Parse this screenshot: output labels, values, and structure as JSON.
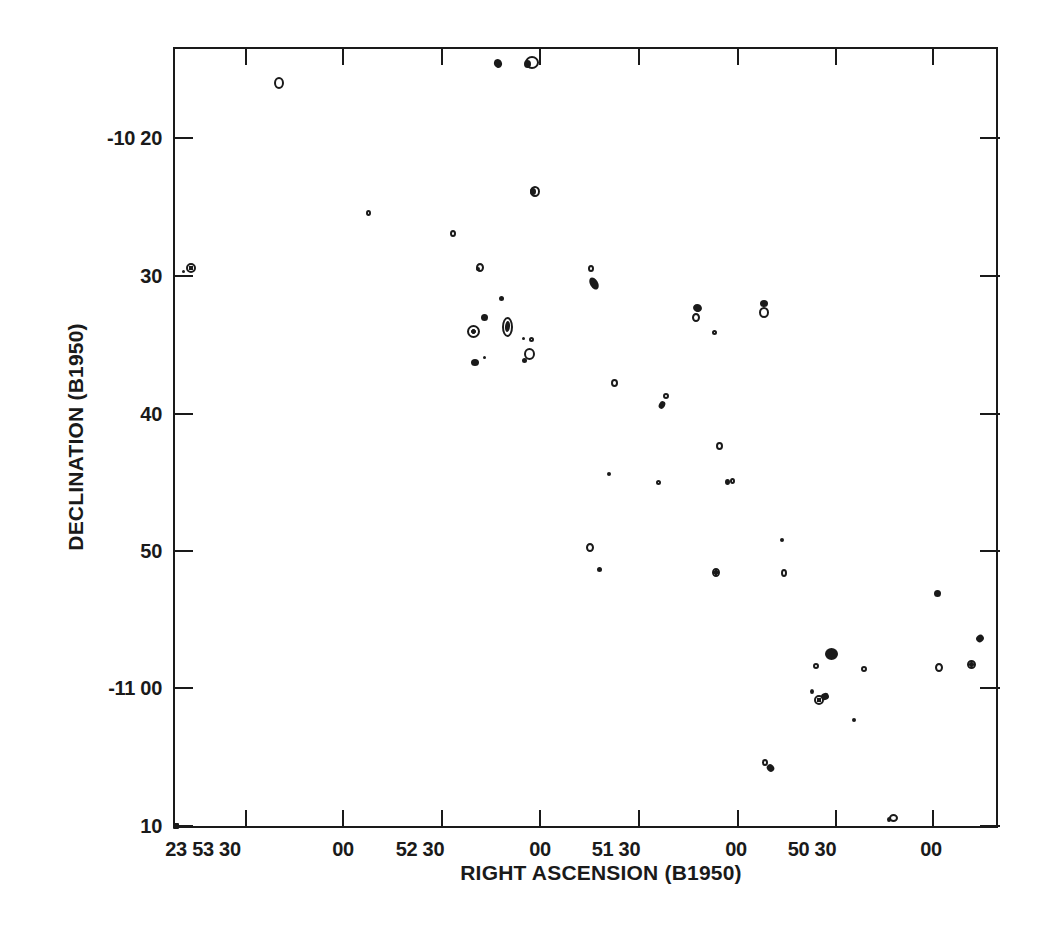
{
  "figure": {
    "ink_color": "#1a1a1a",
    "background_color": "#ffffff"
  },
  "chart_data": {
    "type": "scatter",
    "subtype": "radio-source-contour-sky-map",
    "title": "",
    "xlabel": "RIGHT ASCENSION (B1950)",
    "ylabel": "DECLINATION (B1950)",
    "grid": false,
    "legend": "none",
    "x_axis": {
      "unit": "hh mm ss (RA, increases to the left)",
      "tick_labels": [
        "23 53 30",
        "00",
        "52 30",
        "00",
        "51 30",
        "00",
        "50 30",
        "00"
      ],
      "range_left_to_right": [
        "23 53 52",
        "23 49 40"
      ]
    },
    "y_axis": {
      "unit": "dd mm (Declination)",
      "tick_labels": [
        "-10 20",
        "30",
        "40",
        "50",
        "-11 00",
        "10"
      ],
      "range_top_to_bottom": [
        "-10 13",
        "-11 10"
      ]
    },
    "sources": [
      {
        "ra": "23 53 20",
        "dec": "-10 16",
        "parts": [
          [
            279,
            83,
            10,
            12,
            "ring",
            0
          ]
        ]
      },
      {
        "ra": "23 52 13",
        "dec": "-10 15",
        "parts": [
          [
            498,
            63,
            8,
            9,
            "filled",
            -30
          ]
        ]
      },
      {
        "ra": "23 52 03",
        "dec": "-10 14",
        "parts": [
          [
            532,
            62,
            14,
            13,
            "ring",
            0
          ],
          [
            527,
            64,
            7,
            8,
            "filled",
            0
          ]
        ]
      },
      {
        "ra": "23 52 53",
        "dec": "-10 25",
        "parts": [
          [
            368,
            213,
            5,
            6,
            "ring",
            0
          ]
        ]
      },
      {
        "ra": "23 52 27",
        "dec": "-10 27",
        "parts": [
          [
            453,
            233,
            6,
            7,
            "ring",
            0
          ]
        ]
      },
      {
        "ra": "23 52 02",
        "dec": "-10 24",
        "parts": [
          [
            535,
            191,
            10,
            11,
            "ring",
            0
          ],
          [
            533,
            191,
            6,
            7,
            "filled",
            0
          ]
        ]
      },
      {
        "ra": "23 52 18",
        "dec": "-10 29",
        "parts": [
          [
            480,
            267,
            8,
            9,
            "ring",
            0
          ],
          [
            478,
            269,
            4,
            4,
            "filled",
            0
          ]
        ]
      },
      {
        "ra": "23 53 47",
        "dec": "-10 29",
        "parts": [
          [
            191,
            268,
            10,
            10,
            "bullseye",
            0
          ],
          [
            183,
            271,
            3,
            3,
            "filled",
            0
          ]
        ]
      },
      {
        "ra": "23 51 44",
        "dec": "-10 30",
        "parts": [
          [
            591,
            268,
            6,
            7,
            "ring",
            0
          ],
          [
            594,
            283,
            8,
            13,
            "filled",
            -30
          ]
        ]
      },
      {
        "ra": "23 52 12",
        "dec": "-10 32",
        "parts": [
          [
            501,
            298,
            5,
            5,
            "filled",
            0
          ]
        ]
      },
      {
        "ra": "23 52 17",
        "dec": "-10 33",
        "parts": [
          [
            484,
            317,
            7,
            7,
            "filled",
            0
          ]
        ]
      },
      {
        "ra": "23 52 21",
        "dec": "-10 34",
        "parts": [
          [
            473,
            331,
            13,
            13,
            "bullseye",
            0
          ]
        ]
      },
      {
        "ra": "23 52 10",
        "dec": "-10 34",
        "parts": [
          [
            507,
            327,
            11,
            20,
            "ring",
            0
          ],
          [
            507,
            326,
            5,
            11,
            "filled",
            5
          ]
        ]
      },
      {
        "ra": "23 52 04",
        "dec": "-10 35",
        "parts": [
          [
            523,
            338,
            3,
            3,
            "filled",
            0
          ],
          [
            531,
            339,
            5,
            5,
            "ring",
            0
          ]
        ]
      },
      {
        "ra": "23 52 04",
        "dec": "-10 36",
        "parts": [
          [
            529,
            354,
            11,
            12,
            "ring",
            0
          ],
          [
            524,
            360,
            5,
            5,
            "filled",
            0
          ]
        ]
      },
      {
        "ra": "23 52 21",
        "dec": "-10 36",
        "parts": [
          [
            475,
            362,
            8,
            7,
            "filled",
            0
          ],
          [
            484,
            357,
            3,
            3,
            "filled",
            0
          ]
        ]
      },
      {
        "ra": "23 51 12",
        "dec": "-10 33",
        "parts": [
          [
            697,
            308,
            9,
            8,
            "filled",
            20
          ],
          [
            696,
            317,
            8,
            9,
            "ring",
            0
          ]
        ]
      },
      {
        "ra": "23 51 07",
        "dec": "-10 34",
        "parts": [
          [
            714,
            332,
            5,
            5,
            "ring",
            0
          ]
        ]
      },
      {
        "ra": "23 50 52",
        "dec": "-10 32",
        "parts": [
          [
            764,
            303,
            8,
            7,
            "filled",
            0
          ],
          [
            764,
            312,
            10,
            11,
            "ring",
            0
          ]
        ]
      },
      {
        "ra": "23 51 38",
        "dec": "-10 38",
        "parts": [
          [
            614,
            383,
            7,
            8,
            "ring",
            0
          ]
        ]
      },
      {
        "ra": "23 51 22",
        "dec": "-10 39",
        "parts": [
          [
            666,
            396,
            6,
            6,
            "ring",
            0
          ],
          [
            662,
            405,
            6,
            8,
            "filled",
            30
          ]
        ]
      },
      {
        "ra": "23 51 05",
        "dec": "-10 42",
        "parts": [
          [
            719,
            446,
            7,
            8,
            "ring",
            0
          ]
        ]
      },
      {
        "ra": "23 51 39",
        "dec": "-10 44",
        "parts": [
          [
            609,
            474,
            4,
            4,
            "filled",
            0
          ]
        ]
      },
      {
        "ra": "23 51 24",
        "dec": "-10 45",
        "parts": [
          [
            658,
            482,
            5,
            5,
            "ring",
            0
          ]
        ]
      },
      {
        "ra": "23 51 02",
        "dec": "-10 45",
        "parts": [
          [
            727,
            482,
            5,
            6,
            "filled",
            0
          ],
          [
            732,
            481,
            5,
            6,
            "ring",
            0
          ]
        ]
      },
      {
        "ra": "23 51 45",
        "dec": "-10 50",
        "parts": [
          [
            590,
            547,
            8,
            9,
            "ring",
            0
          ]
        ]
      },
      {
        "ra": "23 51 42",
        "dec": "-10 51",
        "parts": [
          [
            599,
            569,
            5,
            5,
            "filled",
            0
          ]
        ]
      },
      {
        "ra": "23 51 06",
        "dec": "-10 52",
        "parts": [
          [
            716,
            572,
            8,
            9,
            "bullseye",
            0
          ]
        ]
      },
      {
        "ra": "23 50 46",
        "dec": "-10 52",
        "parts": [
          [
            784,
            573,
            6,
            8,
            "ring",
            0
          ]
        ]
      },
      {
        "ra": "23 50 46",
        "dec": "-10 49",
        "parts": [
          [
            782,
            540,
            4,
            4,
            "filled",
            0
          ]
        ]
      },
      {
        "ra": "23 49 59",
        "dec": "-10 53",
        "parts": [
          [
            937,
            593,
            7,
            7,
            "filled",
            0
          ]
        ]
      },
      {
        "ra": "23 49 46",
        "dec": "-10 56",
        "parts": [
          [
            980,
            638,
            8,
            7,
            "filled",
            -40
          ]
        ]
      },
      {
        "ra": "23 50 31",
        "dec": "-10 58",
        "parts": [
          [
            831,
            654,
            13,
            12,
            "filled",
            0
          ]
        ]
      },
      {
        "ra": "23 50 36",
        "dec": "-10 58",
        "parts": [
          [
            816,
            666,
            6,
            6,
            "ring",
            0
          ]
        ]
      },
      {
        "ra": "23 50 21",
        "dec": "-10 58",
        "parts": [
          [
            864,
            669,
            6,
            6,
            "ring",
            0
          ]
        ]
      },
      {
        "ra": "23 49 58",
        "dec": "-10 58",
        "parts": [
          [
            939,
            667,
            8,
            9,
            "ring",
            0
          ]
        ]
      },
      {
        "ra": "23 49 48",
        "dec": "-10 58",
        "parts": [
          [
            971,
            664,
            9,
            9,
            "bullseye",
            0
          ]
        ]
      },
      {
        "ra": "23 50 35",
        "dec": "-11 01",
        "parts": [
          [
            812,
            691,
            4,
            5,
            "filled",
            0
          ],
          [
            819,
            700,
            10,
            10,
            "bullseye",
            0
          ],
          [
            825,
            696,
            8,
            7,
            "filled",
            -20
          ]
        ]
      },
      {
        "ra": "23 50 24",
        "dec": "-11 02",
        "parts": [
          [
            854,
            720,
            4,
            4,
            "filled",
            0
          ]
        ]
      },
      {
        "ra": "23 50 51",
        "dec": "-11 06",
        "parts": [
          [
            765,
            762,
            6,
            7,
            "ring",
            0
          ],
          [
            770,
            768,
            7,
            8,
            "filled",
            -40
          ]
        ]
      },
      {
        "ra": "23 50 12",
        "dec": "-11 09",
        "parts": [
          [
            893,
            818,
            9,
            8,
            "ring",
            0
          ],
          [
            889,
            819,
            4,
            5,
            "filled",
            0
          ]
        ]
      },
      {
        "ra": "23 53 51",
        "dec": "-11 10",
        "parts": [
          [
            176,
            826,
            6,
            6,
            "square",
            0
          ]
        ]
      }
    ]
  },
  "plot": {
    "left": 173,
    "top": 47,
    "right": 998,
    "bottom": 828,
    "tick_len": 18,
    "x_label_top": 838,
    "x_ticks": [
      {
        "px": 246,
        "label": "23 53 30",
        "label_px": 203
      },
      {
        "px": 343,
        "label": "00",
        "label_px": 343
      },
      {
        "px": 442,
        "label": "52 30",
        "label_px": 420
      },
      {
        "px": 540,
        "label": "00",
        "label_px": 540
      },
      {
        "px": 639,
        "label": "51 30",
        "label_px": 616
      },
      {
        "px": 738,
        "label": "00",
        "label_px": 736
      },
      {
        "px": 836,
        "label": "50 30",
        "label_px": 812
      },
      {
        "px": 933,
        "label": "00",
        "label_px": 931
      }
    ],
    "y_ticks": [
      {
        "py": 138,
        "label": "-10 20"
      },
      {
        "py": 276,
        "label": "30"
      },
      {
        "py": 414,
        "label": "40"
      },
      {
        "py": 551,
        "label": "50"
      },
      {
        "py": 688,
        "label": "-11 00"
      },
      {
        "py": 826,
        "label": "10"
      }
    ]
  }
}
